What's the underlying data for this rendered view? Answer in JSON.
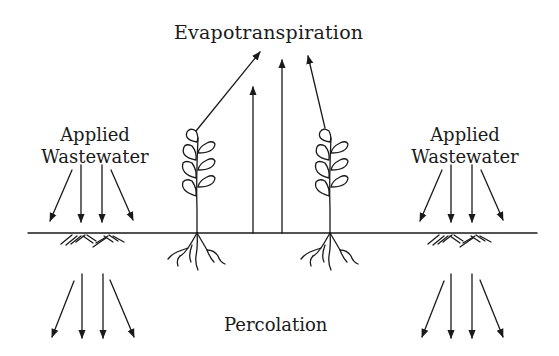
{
  "diagram": {
    "title": "Evapotranspiration",
    "labels": {
      "applied_left_line1": "Applied",
      "applied_left_line2": "Wastewater",
      "applied_right_line1": "Applied",
      "applied_right_line2": "Wastewater",
      "percolation": "Percolation"
    },
    "colors": {
      "ink": "#1a1a1a",
      "background": "#ffffff"
    },
    "elements": [
      "ground-line",
      "plant-left",
      "plant-right",
      "evapotranspiration-arrows",
      "applied-wastewater-arrows-left",
      "applied-wastewater-arrows-right",
      "percolation-arrows-left",
      "percolation-arrows-right",
      "soil-hatching-left",
      "soil-hatching-right"
    ]
  }
}
